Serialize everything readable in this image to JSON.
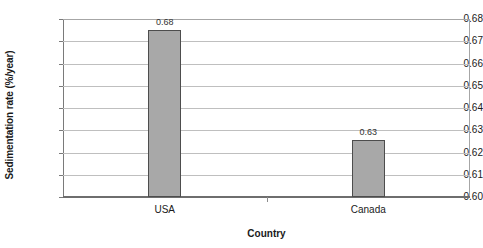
{
  "chart_data": {
    "type": "bar",
    "title": "",
    "xlabel": "Country",
    "ylabel": "Sedimentation rate (%/year)",
    "categories": [
      "USA",
      "Canada"
    ],
    "values": [
      0.675,
      0.6255
    ],
    "data_labels": [
      "0.68",
      "0.63"
    ],
    "ylim": [
      0.6,
      0.68
    ],
    "ytick_labels": [
      "0.68",
      "0.67",
      "0.66",
      "0.65",
      "0.64",
      "0.63",
      "0.62",
      "0.61",
      "0.60"
    ],
    "ytick_values": [
      0.68,
      0.67,
      0.66,
      0.65,
      0.64,
      0.63,
      0.62,
      0.61,
      0.6
    ],
    "grid": true,
    "legend": false,
    "legend_position": "none",
    "series": [
      {
        "name": "Sedimentation rate",
        "values": [
          0.675,
          0.6255
        ],
        "color": "#a8a8a8",
        "border_color": "#4d4d4d"
      }
    ]
  },
  "colors": {
    "bar_fill": "#a8a8a8",
    "bar_border": "#4d4d4d",
    "gridline": "#bfbfbf",
    "axis": "#6e6e6e",
    "text": "#1a1a1a",
    "background": "#ffffff"
  }
}
